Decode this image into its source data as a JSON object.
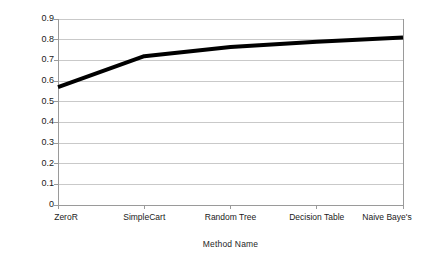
{
  "chart_data": {
    "type": "line",
    "title": "",
    "xlabel": "Method Name",
    "ylabel": "Recall",
    "categories": [
      "ZeroR",
      "SimpleCart",
      "Random Tree",
      "Decision Table",
      "Naive Baye's"
    ],
    "values": [
      0.57,
      0.72,
      0.765,
      0.79,
      0.81
    ],
    "series": [
      {
        "name": "Recall",
        "values": [
          0.57,
          0.72,
          0.765,
          0.79,
          0.81
        ],
        "color": "#000000"
      }
    ],
    "ylim": [
      0,
      0.9
    ],
    "ytick_labels": [
      "0.9",
      "0.8",
      "0.7",
      "0.6",
      "0.5",
      "0.4",
      "0.3",
      "0.2",
      "0.1",
      "0"
    ],
    "ytick_values": [
      0.9,
      0.8,
      0.7,
      0.6,
      0.5,
      0.4,
      0.3,
      0.2,
      0.1,
      0
    ],
    "grid": "horizontal",
    "legend": "none",
    "line_width_px": 4,
    "grid_color": "#c9c9c9",
    "axis_color": "#9a9a9a",
    "background": "#ffffff"
  },
  "axes": {
    "y_title": "Recall",
    "x_title": "Method Name"
  }
}
